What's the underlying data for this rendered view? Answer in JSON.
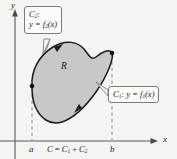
{
  "figure": {
    "background_color": "#f4f4f2",
    "region_fill_color": "#c8c8c8",
    "curve_color": "#1c1c1c",
    "axis_color": "#555555",
    "dashed_color": "#8a8a8a"
  },
  "axes": {
    "y_label": "y",
    "x_label": "x",
    "x_axis_y": 141,
    "y_axis_x": 15
  },
  "region": {
    "label": "R",
    "label_x": 61,
    "label_y": 62
  },
  "callouts": [
    {
      "name": "c2-callout",
      "line1_curve": "C",
      "line1_sub": "2",
      "line1_suffix": ":",
      "line2_lhs": "y = f",
      "line2_sub": "2",
      "line2_rhs": "(x)"
    },
    {
      "name": "c1-callout",
      "curve": "C",
      "curve_sub": "1",
      "text": ": y = f",
      "text_sub": "1",
      "text_rhs": "(x)"
    }
  ],
  "ticks": [
    {
      "name": "tick-a",
      "label": "a",
      "x": 32,
      "y": 146
    },
    {
      "name": "tick-b",
      "label": "b",
      "x": 112,
      "y": 146
    }
  ],
  "equation": {
    "lhs": "C",
    "eq": " = ",
    "term1": "C",
    "term1_sub": "1",
    "plus": " + ",
    "term2": "C",
    "term2_sub": "2",
    "x": 48,
    "y": 146
  },
  "markers": {
    "left_point": {
      "x": 32,
      "y": 86
    },
    "right_point": {
      "x": 112,
      "y": 53
    }
  }
}
